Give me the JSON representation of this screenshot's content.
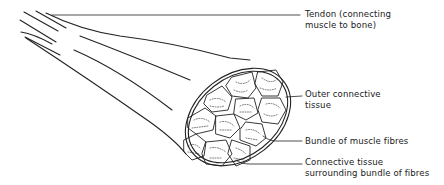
{
  "diagram": {
    "labels": [
      {
        "id": "tendon",
        "text": "Tendon (connecting\nmuscle to bone)"
      },
      {
        "id": "outer-connective-tissue",
        "text": "Outer connective\ntissue"
      },
      {
        "id": "bundle-of-muscle-fibres",
        "text": "Bundle of muscle fibres"
      },
      {
        "id": "connective-tissue-bundle",
        "text": "Connective tissue\nsurrounding bundle of fibres"
      }
    ],
    "colors": {
      "line": "#222222",
      "background": "#ffffff"
    }
  }
}
